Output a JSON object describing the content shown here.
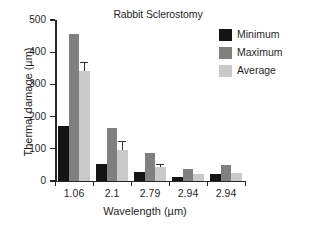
{
  "chart_data": {
    "type": "bar",
    "title": "Rabbit Sclerostomy",
    "xlabel": "Wavelength (µm)",
    "ylabel": "Thermal damage (µm)",
    "categories": [
      "1.06",
      "2.1",
      "2.79",
      "2.94",
      "2.94"
    ],
    "ylim": [
      0,
      500
    ],
    "yticks": [
      0,
      100,
      200,
      300,
      400,
      500
    ],
    "ytick_labels": [
      "0",
      "100",
      "200",
      "300",
      "400",
      "500"
    ],
    "grid": false,
    "legend_position": "top-right",
    "series": [
      {
        "name": "Minimum",
        "color": "#141414",
        "values": [
          170,
          52,
          27,
          13,
          22
        ],
        "errors": [
          0,
          0,
          0,
          0,
          0
        ]
      },
      {
        "name": "Maximum",
        "color": "#808080",
        "values": [
          456,
          165,
          87,
          36,
          50
        ],
        "errors": [
          0,
          0,
          0,
          0,
          0
        ]
      },
      {
        "name": "Average",
        "color": "#c9c9c9",
        "values": [
          341,
          97,
          43,
          21,
          26
        ],
        "errors": [
          28,
          28,
          10,
          0,
          0
        ]
      }
    ]
  },
  "legend": {
    "items": [
      {
        "label": "Minimum",
        "key": "minimum"
      },
      {
        "label": "Maximum",
        "key": "maximum"
      },
      {
        "label": "Average",
        "key": "average"
      }
    ]
  }
}
